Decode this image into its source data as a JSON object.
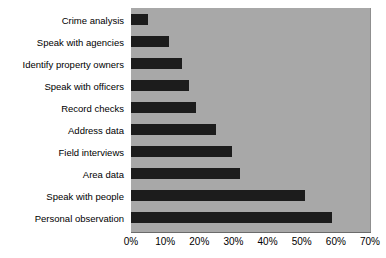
{
  "chart_data": {
    "type": "bar",
    "orientation": "horizontal",
    "title": "",
    "xlabel": "",
    "ylabel": "",
    "xlim": [
      0,
      70
    ],
    "xticks": [
      0,
      10,
      20,
      30,
      40,
      50,
      60,
      70
    ],
    "xtick_labels": [
      "0%",
      "10%",
      "20%",
      "30%",
      "40%",
      "50%",
      "60%",
      "70%"
    ],
    "grid": false,
    "legend": null,
    "categories": [
      "Crime analysis",
      "Speak with agencies",
      "Identify property owners",
      "Speak with officers",
      "Record checks",
      "Address data",
      "Field interviews",
      "Area data",
      "Speak with people",
      "Personal observation"
    ],
    "values": [
      5,
      11,
      15,
      17,
      19,
      25,
      29.5,
      32,
      51,
      59
    ],
    "value_labels": [
      "5%",
      "11%",
      "15%",
      "17%",
      "19%",
      "25%",
      "30%",
      "32%",
      "51%",
      "59%"
    ],
    "colors": {
      "bar": "#1c1c1c",
      "plot_background": "#a8a8a8",
      "page_background": "#ffffff",
      "axis": "#6b6b6b",
      "text": "#000000"
    }
  }
}
